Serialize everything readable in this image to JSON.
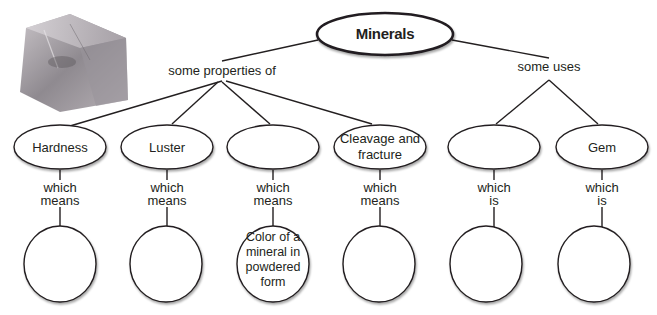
{
  "concept_map": {
    "root": {
      "label": "Minerals"
    },
    "branches": {
      "properties": {
        "link_label": "some properties of"
      },
      "uses": {
        "link_label": "some uses"
      }
    },
    "nodes": [
      {
        "id": "hardness",
        "label_lines": [
          "Hardness"
        ],
        "connector": [
          "which",
          "means"
        ],
        "answer_lines": []
      },
      {
        "id": "luster",
        "label_lines": [
          "Luster"
        ],
        "connector": [
          "which",
          "means"
        ],
        "answer_lines": []
      },
      {
        "id": "blank-property",
        "label_lines": [],
        "connector": [
          "which",
          "means"
        ],
        "answer_lines": [
          "Color of a",
          "mineral in",
          "powdered",
          "form"
        ]
      },
      {
        "id": "cleavage",
        "label_lines": [
          "Cleavage and",
          "fracture"
        ],
        "connector": [
          "which",
          "means"
        ],
        "answer_lines": []
      },
      {
        "id": "blank-use",
        "label_lines": [],
        "connector": [
          "which",
          "is"
        ],
        "answer_lines": []
      },
      {
        "id": "gem",
        "label_lines": [
          "Gem"
        ],
        "connector": [
          "which",
          "is"
        ],
        "answer_lines": []
      }
    ]
  },
  "image": {
    "subject": "mineral-crystal-photo"
  }
}
